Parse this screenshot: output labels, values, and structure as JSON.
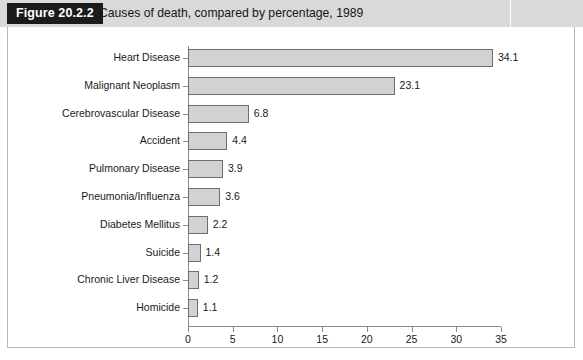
{
  "header": {
    "figure_tag": "Figure 20.2.2",
    "title": "Causes of death, compared by percentage, 1989"
  },
  "chart_data": {
    "type": "bar",
    "orientation": "horizontal",
    "title": "Causes of death, compared by percentage, 1989",
    "xlabel": "",
    "ylabel": "",
    "xlim": [
      0,
      35
    ],
    "xticks": [
      "0",
      "5",
      "10",
      "15",
      "20",
      "25",
      "30",
      "35"
    ],
    "grid": false,
    "legend": false,
    "categories": [
      "Heart Disease",
      "Malignant Neoplasm",
      "Cerebrovascular Disease",
      "Accident",
      "Pulmonary Disease",
      "Pneumonia/Influenza",
      "Diabetes Mellitus",
      "Suicide",
      "Chronic Liver Disease",
      "Homicide"
    ],
    "values": [
      34.1,
      23.1,
      6.8,
      4.4,
      3.9,
      3.6,
      2.2,
      1.4,
      1.2,
      1.1
    ],
    "value_labels": [
      "34.1",
      "23.1",
      "6.8",
      "4.4",
      "3.9",
      "3.6",
      "2.2",
      "1.4",
      "1.2",
      "1.1"
    ],
    "bar_fill_color": "#d2d2d2",
    "bar_border_color": "#6e6e6e",
    "axis_color": "#8a8a8a"
  }
}
